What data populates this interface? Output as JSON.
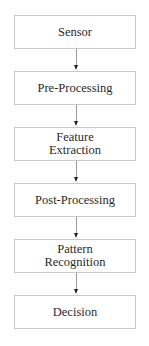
{
  "diagram": {
    "type": "flowchart",
    "direction": "top-to-bottom",
    "nodes": [
      {
        "id": "sensor",
        "label": "Sensor"
      },
      {
        "id": "pre-processing",
        "label": "Pre-Processing"
      },
      {
        "id": "feature-extraction",
        "label": "Feature Extraction",
        "lines": [
          "Feature",
          "Extraction"
        ]
      },
      {
        "id": "post-processing",
        "label": "Post-Processing"
      },
      {
        "id": "pattern-recognition",
        "label": "Pattern Recognition",
        "lines": [
          "Pattern",
          "Recognition"
        ]
      },
      {
        "id": "decision",
        "label": "Decision"
      }
    ],
    "edges": [
      {
        "from": "sensor",
        "to": "pre-processing"
      },
      {
        "from": "pre-processing",
        "to": "feature-extraction"
      },
      {
        "from": "feature-extraction",
        "to": "post-processing"
      },
      {
        "from": "post-processing",
        "to": "pattern-recognition"
      },
      {
        "from": "pattern-recognition",
        "to": "decision"
      }
    ],
    "colors": {
      "border": "#c8c8c8",
      "line": "#9a9a9a",
      "arrowhead": "#222222",
      "text": "#2a2a2a",
      "background": "#ffffff"
    }
  }
}
